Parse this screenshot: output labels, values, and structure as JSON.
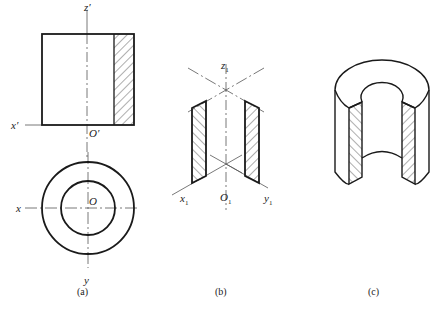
{
  "figure": {
    "panels": [
      {
        "id": "a",
        "caption": "(a)",
        "description": "Orthographic projections: front view (half section) and top view of a hollow cylinder",
        "labels": {
          "z_prime": "z′",
          "x_prime": "x′",
          "o_prime": "O′",
          "x": "x",
          "o": "O",
          "y": "y"
        }
      },
      {
        "id": "b",
        "caption": "(b)",
        "description": "Axonometric axes with cut section faces",
        "labels": {
          "z1": "z",
          "x1": "x",
          "o1": "O",
          "y1": "y",
          "sub": "1"
        }
      },
      {
        "id": "c",
        "caption": "(c)",
        "description": "Isometric cutaway view of hollow cylinder (quarter removed) with hatched section"
      }
    ],
    "colors": {
      "line": "#1a1a1a",
      "axis": "#555555",
      "background": "#ffffff"
    }
  }
}
